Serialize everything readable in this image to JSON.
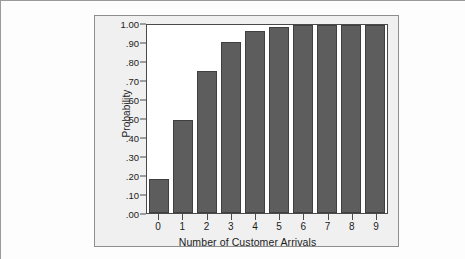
{
  "chart_data": {
    "type": "bar",
    "title": "",
    "subtitle": "",
    "xlabel": "Number of Customer Arrivals",
    "ylabel": "Probability",
    "categories": [
      "0",
      "1",
      "2",
      "3",
      "4",
      "5",
      "6",
      "7",
      "8",
      "9"
    ],
    "values": [
      0.183,
      0.493,
      0.757,
      0.907,
      0.97,
      0.992,
      0.998,
      1.0,
      1.0,
      1.0
    ],
    "series": [
      {
        "name": "Cumulative probability",
        "values": [
          0.183,
          0.493,
          0.757,
          0.907,
          0.97,
          0.992,
          0.998,
          1.0,
          1.0,
          1.0
        ]
      }
    ],
    "ylim": [
      0.0,
      1.0
    ],
    "xlim": [
      -0.5,
      9.5
    ],
    "ytick_values": [
      1.0,
      0.9,
      0.8,
      0.7,
      0.6,
      0.5,
      0.4,
      0.3,
      0.2,
      0.1,
      0.0
    ],
    "ytick_labels": [
      "1.00",
      ".90",
      ".80",
      ".70",
      ".60",
      ".50",
      ".40",
      ".30",
      ".20",
      ".10",
      ".00"
    ],
    "xtick_labels": [
      "0",
      "1",
      "2",
      "3",
      "4",
      "5",
      "6",
      "7",
      "8",
      "9"
    ],
    "grid": false,
    "legend": null,
    "legend_position": "none",
    "bar_color": "#5d5d5d",
    "bar_edge_color": "#3f3f3f",
    "plot_background": "#ffffff",
    "panel_background": "#f0f0f0",
    "axis_color": "#4a4a4a",
    "text_color": "#1c1c1c"
  }
}
